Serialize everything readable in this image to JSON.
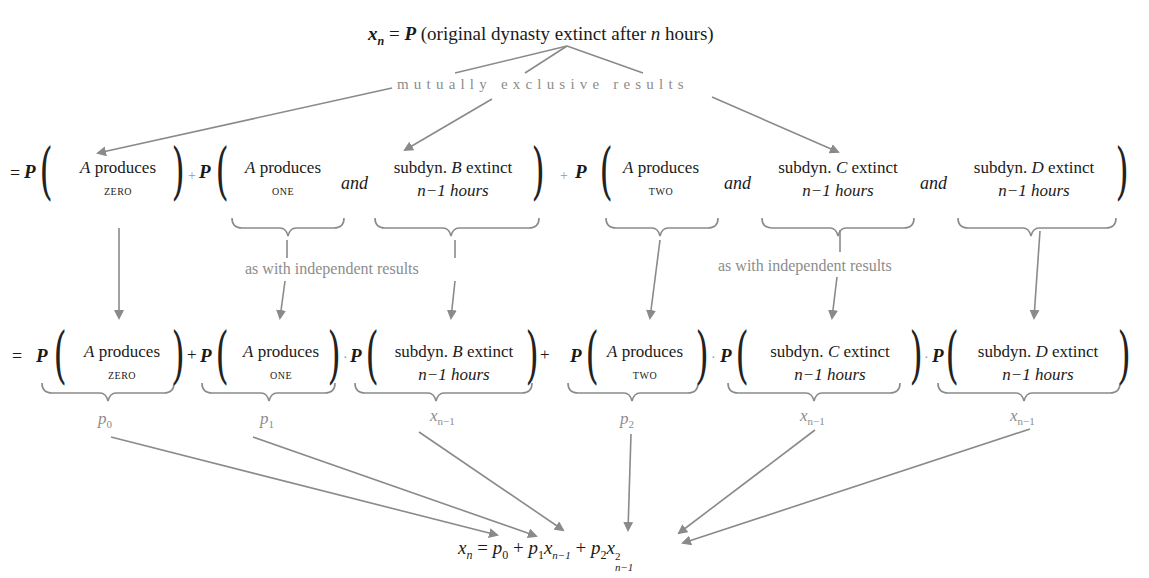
{
  "title": {
    "lhs": "x",
    "lhs_sub": "n",
    "eq": " = ",
    "P": "P",
    "text_open": " (original dynasty extinct after ",
    "n": "n",
    "text_close": " hours)"
  },
  "annotations": {
    "mutually_exclusive": "mutually exclusive results",
    "independent_left": "as with independent results",
    "independent_right": "as with independent results"
  },
  "row1": {
    "eq": "=",
    "P": "P",
    "plus": "+",
    "and": "and",
    "terms": [
      {
        "line1_var": "A",
        "line1": " produces",
        "line2": "zero"
      },
      {
        "line1_var": "A",
        "line1": " produces",
        "line2": "one"
      },
      {
        "line1_pre": "subdyn. ",
        "line1_var": "B",
        "line1": " extinct",
        "line2": "n−1 hours"
      },
      {
        "line1_var": "A",
        "line1": " produces",
        "line2": "two"
      },
      {
        "line1_pre": "subdyn. ",
        "line1_var": "C",
        "line1": " extinct",
        "line2": "n−1 hours"
      },
      {
        "line1_pre": "subdyn. ",
        "line1_var": "D",
        "line1": " extinct",
        "line2": "n−1 hours"
      }
    ]
  },
  "row2": {
    "eq": "=",
    "P": "P",
    "plus": "+",
    "dot": "·",
    "terms": [
      {
        "line1_var": "A",
        "line1": " produces",
        "line2": "zero",
        "label": "p",
        "label_sub": "0"
      },
      {
        "line1_var": "A",
        "line1": " produces",
        "line2": "one",
        "label": "p",
        "label_sub": "1"
      },
      {
        "line1_pre": "subdyn. ",
        "line1_var": "B",
        "line1": " extinct",
        "line2": "n−1 hours",
        "label": "x",
        "label_sub": "n−1"
      },
      {
        "line1_var": "A",
        "line1": " produces",
        "line2": "two",
        "label": "p",
        "label_sub": "2"
      },
      {
        "line1_pre": "subdyn. ",
        "line1_var": "C",
        "line1": " extinct",
        "line2": "n−1 hours",
        "label": "x",
        "label_sub": "n−1"
      },
      {
        "line1_pre": "subdyn. ",
        "line1_var": "D",
        "line1": " extinct",
        "line2": "n−1 hours",
        "label": "x",
        "label_sub": "n−1"
      }
    ]
  },
  "result": {
    "x": "x",
    "x_sub": "n",
    "eq": " = ",
    "p0": "p",
    "p0_sub": "0",
    "plus1": " + ",
    "p1": "p",
    "p1_sub": "1",
    "x1": "x",
    "x1_sub": "n−1",
    "plus2": " + ",
    "p2": "p",
    "p2_sub": "2",
    "x2": "x",
    "x2_sub": "n−1",
    "x2_sup": "2"
  },
  "colors": {
    "text": "#1a1a1a",
    "annotation_gray": "#8c8c8c",
    "arrow_gray": "#8a8a8a"
  }
}
